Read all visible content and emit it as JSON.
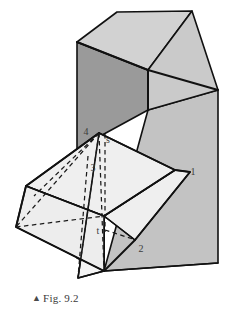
{
  "figure": {
    "caption_marker": "▲",
    "caption_text": "Fig. 9.2",
    "title": "Fig. 9.2",
    "background_color": "#ffffff"
  },
  "colors": {
    "top_face": "#d2d2d2",
    "right_face": "#c3c3c3",
    "left_face": "#9a9a9a",
    "flap_front": "#efefef",
    "flap_back": "#e9e9e9",
    "flap_under": "#f4f4f4",
    "outline": "#111111",
    "dashed": "#1a1a1a",
    "label_text": "#3c3c3c"
  },
  "labels": [
    {
      "id": "label-4",
      "text": "4",
      "x": 90,
      "y": 131
    },
    {
      "id": "label-s",
      "text": "s",
      "x": 106,
      "y": 139
    },
    {
      "id": "label-3",
      "text": "3",
      "x": 93,
      "y": 167
    },
    {
      "id": "label-1",
      "text": "1",
      "x": 191,
      "y": 172
    },
    {
      "id": "label-t",
      "text": "t",
      "x": 97,
      "y": 231
    },
    {
      "id": "label-2",
      "text": "2",
      "x": 140,
      "y": 249
    }
  ],
  "geometry": {
    "box": {
      "top_face": "77,42 117,12 192,11 148,70",
      "top_face_right": "148,70 192,11 218,90 148,110",
      "left_face": "77,42 148,70 148,110 104,134 104,271 77,258",
      "right_face": "148,110 218,90 218,263 104,271",
      "lid_edge_left": "77,42 148,70",
      "lid_edge_right": "148,70 218,90",
      "vertical_front": "148,70 148,110"
    },
    "flap": {
      "front_panel": "99,133 175,170 104,216 26,186",
      "lower_panel": "26,186 104,216 104,271 16,227",
      "under_panel": "99,133 104,216 104,271 78,278",
      "right_wing": "175,170 104,216 135,240 190,172",
      "fold_edge": "26,186 104,216"
    },
    "dashed_lines": [
      "99,133 16,227",
      "99,133 104,271",
      "99,133 78,278",
      "104,134 104,228",
      "16,227 104,216",
      "104,228 135,240",
      "26,186 99,133"
    ],
    "solid_lines": [
      "99,133 175,170",
      "175,170 190,172",
      "190,172 135,240",
      "135,240 104,271",
      "104,271 16,227",
      "16,227 26,186",
      "26,186 99,133",
      "26,186 104,216",
      "104,216 175,170",
      "104,216 135,240",
      "99,133 78,278",
      "78,278 104,271"
    ]
  }
}
